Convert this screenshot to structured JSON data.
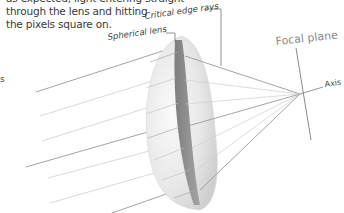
{
  "caption": {
    "line1": "as expected, light entering straight",
    "line2": "through the lens and hitting",
    "line3": "the pixels square on."
  },
  "side_fragment": "s",
  "labels": {
    "spherical_lens": "Spherical lens",
    "critical_edge_rays": "Critical edge rays",
    "focal_plane": "Focal plane",
    "axis": "Axis"
  },
  "colors": {
    "ray": "#9a9a9a",
    "ray_light": "#c8c8c8",
    "lens_body": "#e6e6e6",
    "lens_section": "#8f8f8f",
    "label_text": "#444444",
    "focal_plane_text": "#8a8a8a"
  }
}
